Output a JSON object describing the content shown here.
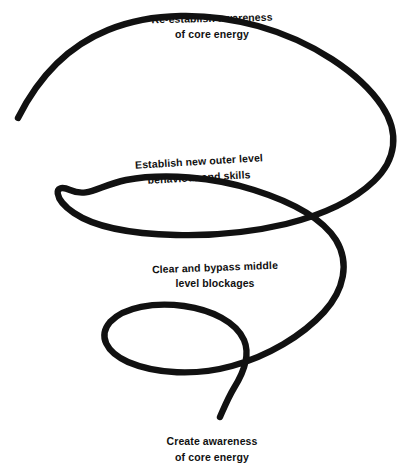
{
  "page": {
    "background_color": "#ffffff",
    "width": 414,
    "height": 476
  },
  "diagram": {
    "name": "inward-spiral",
    "stroke_color": "#111111",
    "stroke_width": 6.2,
    "start_point": {
      "x": 18,
      "y": 118
    },
    "end_point": {
      "x": 220,
      "y": 417
    },
    "rightmost_point": {
      "x": 396,
      "y": 128
    },
    "leftmost_point": {
      "x": 57,
      "y": 222
    },
    "crossing_point": {
      "x": 328,
      "y": 226
    }
  },
  "labels": [
    {
      "name": "re-establish-awareness",
      "line1": "Re-establish awareness",
      "line2": "of core energy"
    },
    {
      "name": "establish-new-outer-level",
      "line1": "Establish new outer level",
      "line2": "behaviour and skills"
    },
    {
      "name": "clear-and-bypass-middle",
      "line1": "Clear and bypass middle",
      "line2": "level blockages"
    },
    {
      "name": "create-awareness",
      "line1": "Create awareness",
      "line2": "of core energy"
    }
  ]
}
